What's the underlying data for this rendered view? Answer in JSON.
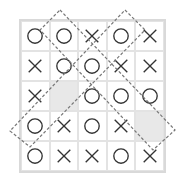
{
  "board": {
    "rows": 5,
    "cols": 5,
    "cells": [
      [
        "O",
        "O",
        "X",
        "O",
        "X"
      ],
      [
        "X",
        "O",
        "O",
        "X",
        "X"
      ],
      [
        "X",
        "",
        "O",
        "O",
        "O"
      ],
      [
        "O",
        "X",
        "O",
        "X",
        ""
      ],
      [
        "O",
        "X",
        "X",
        "O",
        "X"
      ]
    ],
    "shaded": [
      [
        2,
        1
      ],
      [
        3,
        4
      ]
    ]
  },
  "highlights": [
    {
      "name": "diagonal-highlight-down-right",
      "points": "60,10 175,130 153,150 40,30"
    },
    {
      "name": "diagonal-highlight-down-left",
      "points": "125,10 145,30 30,147 10,131"
    }
  ],
  "colors": {
    "mark": "#333333",
    "grid": "#e3e3e3",
    "shade": "#e8e8e8",
    "dash": "#777777"
  }
}
